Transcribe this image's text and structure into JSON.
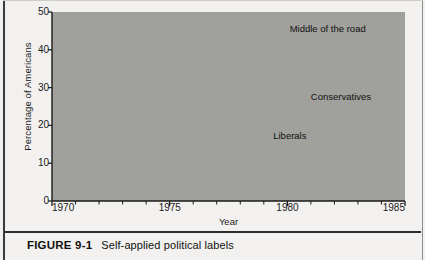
{
  "figure": {
    "caption_number": "FIGURE 9-1",
    "caption_text": "Self-applied political labels"
  },
  "chart_data": {
    "type": "line",
    "title": "",
    "xlabel": "Year",
    "ylabel": "Percentage of Americans",
    "xlim": [
      1970,
      1985
    ],
    "ylim": [
      0,
      50
    ],
    "xticks": [
      1970,
      1975,
      1980,
      1985
    ],
    "xtick_labels": [
      "1970",
      "1975",
      "1980",
      "1985"
    ],
    "x_minor_tick_step": 1,
    "yticks": [
      0,
      10,
      20,
      30,
      40,
      50
    ],
    "ytick_labels": [
      "0",
      "10",
      "20",
      "30",
      "40",
      "50"
    ],
    "grid": "horizontal",
    "legend": "inline-annotations",
    "plot_background": "#a0a09d",
    "line_color": "#111111",
    "gridline_color": "#6e6e6b",
    "x": [
      1970,
      1971,
      1972,
      1973,
      1974,
      1975,
      1976,
      1977,
      1978,
      1979,
      1980,
      1981,
      1982,
      1983,
      1984
    ],
    "series": [
      {
        "name": "Middle of the road",
        "label": "Middle of the road",
        "label_x": 1980.1,
        "label_y": 45.5,
        "values": [
          38.5,
          40,
          39,
          40.5,
          42,
          43,
          39,
          36,
          35,
          41,
          39,
          42,
          41,
          38,
          41
        ]
      },
      {
        "name": "Conservatives",
        "label": "Conservatives",
        "label_x": 1981.0,
        "label_y": 27.5,
        "values": [
          38,
          39,
          36.5,
          34.5,
          32.5,
          30.5,
          28,
          31,
          27,
          29,
          29,
          31.5,
          34,
          32,
          32
        ]
      },
      {
        "name": "Liberals",
        "label": "Liberals",
        "label_x": 1979.4,
        "label_y": 17.2,
        "values": [
          26.5,
          24,
          26.5,
          24.5,
          22,
          18,
          20,
          20,
          20.5,
          22,
          21,
          19,
          15,
          16,
          16
        ]
      }
    ]
  }
}
